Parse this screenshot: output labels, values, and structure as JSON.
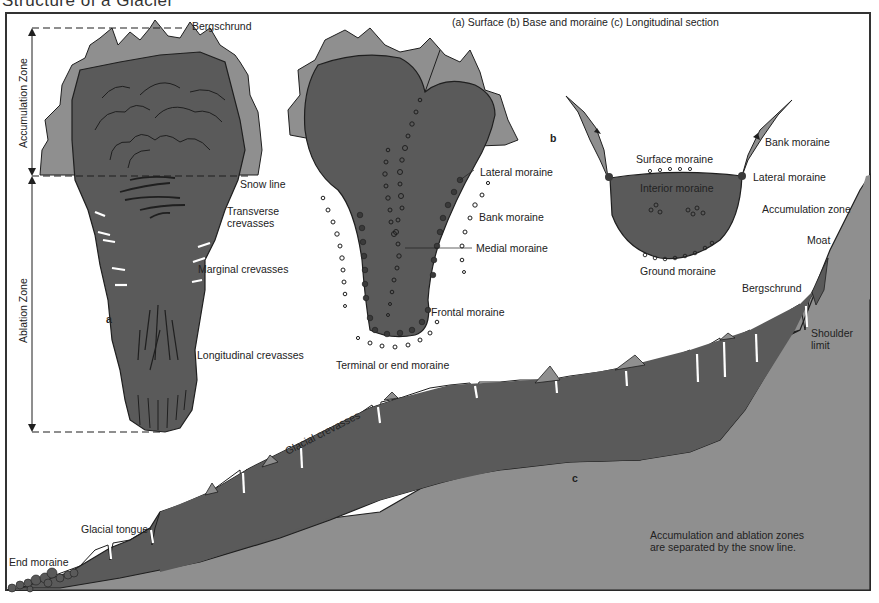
{
  "title": "Structure of a Glacier",
  "legend": "(a) Surface   (b) Base and moraine   (c) Longitudinal section",
  "colors": {
    "glacier_dark": "#5a5a5a",
    "rock_light": "#8f8f8f",
    "outline": "#1f1f1f",
    "background": "#ffffff"
  },
  "panel_a": {
    "id": "a",
    "zones": {
      "accumulation": "Accumulation Zone",
      "ablation": "Ablation Zone"
    },
    "labels": {
      "bergschrund": "Bergschrund",
      "snow_line": "Snow line",
      "transverse_1": "Transverse",
      "transverse_2": "crevasses",
      "marginal": "Marginal crevasses",
      "longitudinal": "Longitudinal crevasses"
    }
  },
  "panel_b_surface": {
    "labels": {
      "lateral": "Lateral moraine",
      "bank": "Bank moraine",
      "medial": "Medial moraine",
      "frontal": "Frontal moraine",
      "terminal": "Terminal or end moraine"
    }
  },
  "panel_b": {
    "id": "b",
    "labels": {
      "bank": "Bank moraine",
      "surface": "Surface moraine",
      "lateral": "Lateral moraine",
      "interior": "Interior moraine",
      "ground": "Ground moraine"
    }
  },
  "panel_c": {
    "id": "c",
    "labels": {
      "accumulation_zone": "Accumulation zone",
      "moat": "Moat",
      "bergschrund": "Bergschrund",
      "shoulder_1": "Shoulder",
      "shoulder_2": "limit",
      "glacial_crevasses": "Glacial crevasses",
      "glacial_tongue": "Glacial tongue",
      "end_moraine": "End moraine",
      "note_1": "Accumulation and ablation zones",
      "note_2": "are separated by the snow line."
    }
  }
}
